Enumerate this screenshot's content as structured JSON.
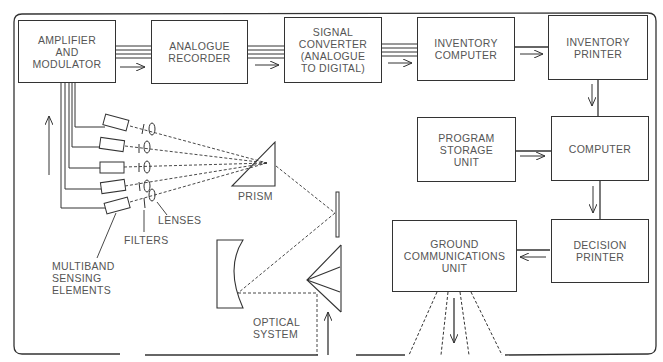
{
  "diagram": {
    "type": "block-diagram",
    "blocks": {
      "amplifier": "AMPLIFIER\nAND\nMODULATOR",
      "analogue_recorder": "ANALOGUE\nRECORDER",
      "signal_converter": "SIGNAL\nCONVERTER\n(ANALOGUE\nTO DIGITAL)",
      "inventory_computer": "INVENTORY\nCOMPUTER",
      "inventory_printer": "INVENTORY\nPRINTER",
      "program_storage": "PROGRAM\nSTORAGE\nUNIT",
      "computer": "COMPUTER",
      "decision_printer": "DECISION\nPRINTER",
      "ground_comms": "GROUND\nCOMMUNICATIONS\nUNIT"
    },
    "labels": {
      "prism": "PRISM",
      "lenses": "LENSES",
      "filters": "FILTERS",
      "sensing": "MULTIBAND\nSENSING\nELEMENTS",
      "optical": "OPTICAL\nSYSTEM"
    },
    "connections": [
      {
        "from": "AMPLIFIER AND MODULATOR",
        "to": "ANALOGUE RECORDER"
      },
      {
        "from": "ANALOGUE RECORDER",
        "to": "SIGNAL CONVERTER (ANALOGUE TO DIGITAL)"
      },
      {
        "from": "SIGNAL CONVERTER (ANALOGUE TO DIGITAL)",
        "to": "INVENTORY COMPUTER"
      },
      {
        "from": "INVENTORY COMPUTER",
        "to": "INVENTORY PRINTER"
      },
      {
        "from": "INVENTORY PRINTER",
        "to": "COMPUTER"
      },
      {
        "from": "PROGRAM STORAGE UNIT",
        "to": "COMPUTER"
      },
      {
        "from": "COMPUTER",
        "to": "DECISION PRINTER"
      },
      {
        "from": "DECISION PRINTER",
        "to": "GROUND COMMUNICATIONS UNIT"
      },
      {
        "from": "MULTIBAND SENSING ELEMENTS",
        "to": "AMPLIFIER AND MODULATOR"
      },
      {
        "from": "OPTICAL SYSTEM",
        "to": "PRISM"
      },
      {
        "from": "PRISM",
        "to": "MULTIBAND SENSING ELEMENTS"
      }
    ],
    "sensing_element_count": 5,
    "colors": {
      "line": "#333333",
      "text": "#555555",
      "background": "#ffffff"
    }
  }
}
